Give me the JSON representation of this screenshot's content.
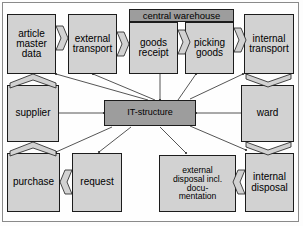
{
  "diagram": {
    "colors": {
      "node_fill": "#d2d2d2",
      "accent_fill": "#9d9d9d",
      "stroke": "#1c1c1c",
      "frame": "#8a8a8a",
      "background": "#fefefe"
    },
    "group_label": "central warehouse",
    "center": {
      "label": "IT-structure"
    },
    "nodes": [
      {
        "id": "article-master-data",
        "label": "article\nmaster\ndata"
      },
      {
        "id": "external-transport",
        "label": "external\ntransport"
      },
      {
        "id": "goods-receipt",
        "label": "goods\nreceipt"
      },
      {
        "id": "picking-goods",
        "label": "picking\ngoods"
      },
      {
        "id": "internal-transport",
        "label": "internal\ntransport"
      },
      {
        "id": "supplier",
        "label": "supplier"
      },
      {
        "id": "ward",
        "label": "ward"
      },
      {
        "id": "purchase",
        "label": "purchase"
      },
      {
        "id": "request",
        "label": "request"
      },
      {
        "id": "external-disposal",
        "label": "external\ndisposal incl.\ndocu-\nmentation"
      },
      {
        "id": "internal-disposal",
        "label": "internal\ndisposal"
      }
    ],
    "flow_arrows": [
      {
        "from": "article-master-data",
        "to": "external-transport",
        "direction": "right"
      },
      {
        "from": "external-transport",
        "to": "goods-receipt",
        "direction": "right"
      },
      {
        "from": "goods-receipt",
        "to": "picking-goods",
        "direction": "right"
      },
      {
        "from": "picking-goods",
        "to": "internal-transport",
        "direction": "right"
      },
      {
        "from": "supplier",
        "to": "article-master-data",
        "direction": "up"
      },
      {
        "from": "purchase",
        "to": "supplier",
        "direction": "up"
      },
      {
        "from": "internal-transport",
        "to": "ward",
        "direction": "down"
      },
      {
        "from": "ward",
        "to": "internal-disposal",
        "direction": "down"
      },
      {
        "from": "request",
        "to": "purchase",
        "direction": "left"
      },
      {
        "from": "internal-disposal",
        "to": "external-disposal",
        "direction": "left"
      }
    ],
    "center_links": [
      "article-master-data",
      "external-transport",
      "goods-receipt",
      "picking-goods",
      "internal-transport",
      "supplier",
      "ward",
      "purchase",
      "request",
      "external-disposal",
      "internal-disposal"
    ]
  }
}
